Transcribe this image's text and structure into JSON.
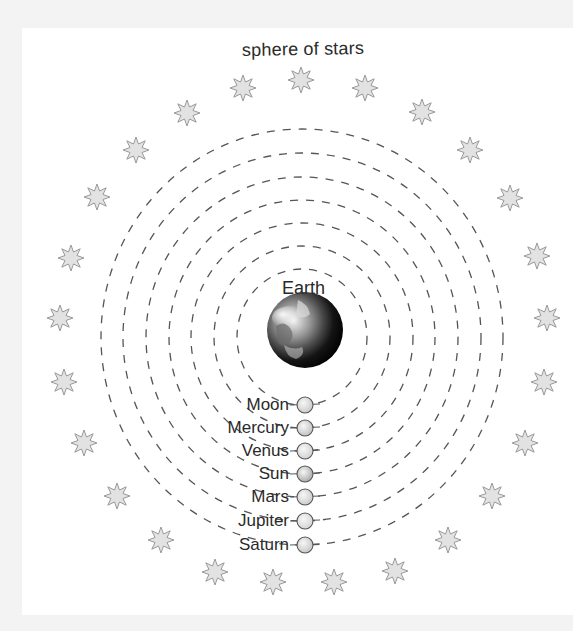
{
  "diagram": {
    "title": "sphere of stars",
    "center_label": "Earth",
    "center": {
      "x": 302,
      "y": 337
    },
    "colors": {
      "background": "#f3f3f3",
      "panel": "#ffffff",
      "orbit": "#555555",
      "star_fill": "#e2e2e2",
      "star_stroke": "#9a9a9a",
      "text": "#2a2a2a"
    },
    "orbits": [
      {
        "name": "Moon",
        "rx": 65,
        "ry": 68
      },
      {
        "name": "Mercury",
        "rx": 88,
        "ry": 91
      },
      {
        "name": "Venus",
        "rx": 111,
        "ry": 114
      },
      {
        "name": "Sun",
        "rx": 133,
        "ry": 137
      },
      {
        "name": "Mars",
        "rx": 156,
        "ry": 160
      },
      {
        "name": "Jupiter",
        "rx": 179,
        "ry": 184
      },
      {
        "name": "Saturn",
        "rx": 201,
        "ry": 208
      }
    ],
    "bodies": [
      {
        "label": "Moon",
        "y": 405,
        "shade": "#c8c8c8"
      },
      {
        "label": "Mercury",
        "y": 428,
        "shade": "#c0c0c0"
      },
      {
        "label": "Venus",
        "y": 451,
        "shade": "#d0d0d0"
      },
      {
        "label": "Sun",
        "y": 474,
        "shade": "#a8a8a8"
      },
      {
        "label": "Mars",
        "y": 497,
        "shade": "#cacaca"
      },
      {
        "label": "Jupiter",
        "y": 521,
        "shade": "#d4d4d4"
      },
      {
        "label": "Saturn",
        "y": 545,
        "shade": "#c4c4c4"
      }
    ],
    "stars": [
      [
        301,
        80
      ],
      [
        365,
        88
      ],
      [
        422,
        112
      ],
      [
        470,
        150
      ],
      [
        510,
        198
      ],
      [
        537,
        256
      ],
      [
        547,
        318
      ],
      [
        544,
        382
      ],
      [
        525,
        443
      ],
      [
        492,
        496
      ],
      [
        448,
        540
      ],
      [
        395,
        571
      ],
      [
        334,
        582
      ],
      [
        273,
        582
      ],
      [
        215,
        572
      ],
      [
        161,
        540
      ],
      [
        117,
        496
      ],
      [
        84,
        443
      ],
      [
        64,
        382
      ],
      [
        60,
        318
      ],
      [
        71,
        258
      ],
      [
        97,
        197
      ],
      [
        136,
        150
      ],
      [
        187,
        113
      ],
      [
        243,
        88
      ]
    ]
  }
}
